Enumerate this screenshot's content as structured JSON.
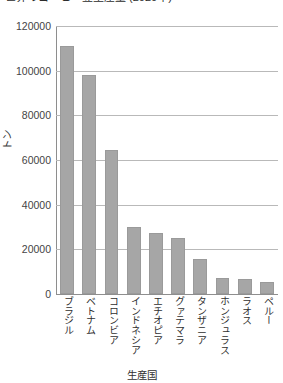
{
  "chart_data": {
    "type": "bar",
    "title": "世界のコーヒー豆生産量 (2020年)",
    "xlabel": "生産国",
    "ylabel": "トン",
    "categories": [
      "ブラジル",
      "ベトナム",
      "コロンビア",
      "インドネシア",
      "エチオピア",
      "グァテマラ",
      "タンザニア",
      "ホンジュラス",
      "ラオス",
      "ペルー"
    ],
    "values": [
      111000,
      98000,
      64500,
      30000,
      27500,
      25000,
      15500,
      7000,
      6500,
      5500
    ],
    "ylim": [
      0,
      120000
    ],
    "yticks": [
      0,
      20000,
      40000,
      60000,
      80000,
      100000,
      120000
    ],
    "ytick_labels": [
      "0",
      "20000",
      "40000",
      "60000",
      "80000",
      "100000",
      "120000"
    ],
    "grid": true,
    "legend": false,
    "bar_color": "#a6a6a6",
    "grid_color": "#b9b9b9",
    "axis_color": "#8e8e8e"
  }
}
